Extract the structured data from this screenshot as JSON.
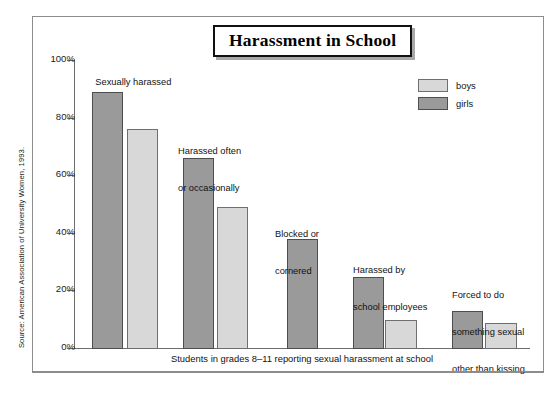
{
  "figure": {
    "title": "Harassment in School",
    "source_note": "Source: American Association of University Women, 1993."
  },
  "legend": {
    "position": "top-right",
    "entries": [
      {
        "label": "boys",
        "color": "#d8d8d8"
      },
      {
        "label": "girls",
        "color": "#9a9a9a"
      }
    ]
  },
  "axes": {
    "x_caption": "Students in grades 8–11 reporting sexual harassment at school",
    "y_ticks": [
      "100%",
      "80%",
      "60%",
      "40%",
      "20%",
      "0%"
    ],
    "y_tick_values": [
      100,
      80,
      60,
      40,
      20,
      0
    ],
    "ylim": [
      0,
      100
    ]
  },
  "annotations": [
    {
      "id": "ann-1",
      "text": "Sexually harassed"
    },
    {
      "id": "ann-2",
      "line1": "Harassed often",
      "line2": "or occasionally"
    },
    {
      "id": "ann-3",
      "line1": "Blocked or",
      "line2": "cornered"
    },
    {
      "id": "ann-4",
      "line1": "Harassed by",
      "line2": "school employees"
    },
    {
      "id": "ann-5",
      "line1": "Forced to do",
      "line2": "something sexual",
      "line3": "other than kissing"
    }
  ],
  "chart_data": {
    "type": "bar",
    "title": "Harassment in School",
    "xlabel": "Students in grades 8–11 reporting sexual harassment at school",
    "ylabel": "",
    "ylim": [
      0,
      100
    ],
    "y_unit": "%",
    "grid": false,
    "legend_position": "top-right",
    "categories": [
      "Sexually harassed",
      "Harassed often or occasionally",
      "Blocked or cornered",
      "Harassed by school employees",
      "Forced to do something sexual other than kissing"
    ],
    "series": [
      {
        "name": "girls",
        "color": "#9a9a9a",
        "values": [
          89,
          66,
          38,
          25,
          13
        ]
      },
      {
        "name": "boys",
        "color": "#d8d8d8",
        "values": [
          76,
          49,
          null,
          10,
          9
        ]
      }
    ]
  }
}
